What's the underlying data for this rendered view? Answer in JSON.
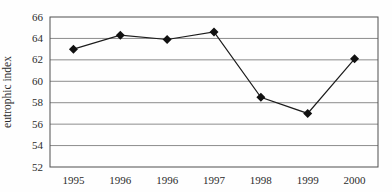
{
  "chart_data": {
    "type": "line",
    "categories": [
      "1995",
      "1996",
      "1996",
      "1997",
      "1998",
      "1999",
      "2000"
    ],
    "series": [
      {
        "name": "eutrophic index",
        "values": [
          63.0,
          64.3,
          63.9,
          64.6,
          58.5,
          57.0,
          62.1
        ]
      }
    ],
    "title": "",
    "xlabel": "",
    "ylabel": "eutrophic index",
    "ylim": [
      52,
      66
    ],
    "ytick_step": 2,
    "yticks": [
      52,
      54,
      56,
      58,
      60,
      62,
      64,
      66
    ],
    "grid": true,
    "legend": "none",
    "marker": "diamond",
    "colors": {
      "line": "#1c1c1c",
      "marker": "#111111",
      "grid": "#8c8c8c",
      "border": "#4f4f4f",
      "text": "#2b2b2b",
      "background": "#fefefe"
    }
  }
}
